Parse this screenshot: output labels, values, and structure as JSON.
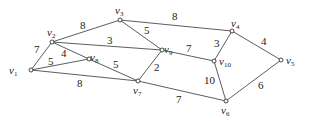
{
  "graph": {
    "nodes": [
      {
        "id": "v1",
        "label": "v",
        "sub": "1",
        "x": 31,
        "y": 70,
        "lx": 9,
        "ly": 74
      },
      {
        "id": "v2",
        "label": "v",
        "sub": "2",
        "x": 52,
        "y": 42,
        "lx": 47,
        "ly": 36
      },
      {
        "id": "v3",
        "label": "v",
        "sub": "3",
        "x": 120,
        "y": 20,
        "lx": 115,
        "ly": 14
      },
      {
        "id": "v4",
        "label": "v",
        "sub": "4",
        "x": 232,
        "y": 31,
        "lx": 231,
        "ly": 27
      },
      {
        "id": "v5",
        "label": "v",
        "sub": "5",
        "x": 281,
        "y": 60,
        "lx": 286,
        "ly": 64
      },
      {
        "id": "v6",
        "label": "v",
        "sub": "6",
        "x": 226,
        "y": 101,
        "lx": 221,
        "ly": 114
      },
      {
        "id": "v7",
        "label": "v",
        "sub": "7",
        "x": 138,
        "y": 81,
        "lx": 133,
        "ly": 94
      },
      {
        "id": "v8",
        "label": "v",
        "sub": "8",
        "x": 89,
        "y": 59,
        "lx": 90,
        "ly": 61
      },
      {
        "id": "v9",
        "label": "v",
        "sub": "9",
        "x": 162,
        "y": 50,
        "lx": 164,
        "ly": 53
      },
      {
        "id": "v10",
        "label": "v",
        "sub": "10",
        "x": 214,
        "y": 61,
        "lx": 219,
        "ly": 65
      }
    ],
    "edges": [
      {
        "from": "v1",
        "to": "v2",
        "weight": "7",
        "wx": 34,
        "wy": 53
      },
      {
        "from": "v1",
        "to": "v8",
        "weight": "5",
        "wx": 48,
        "wy": 65
      },
      {
        "from": "v1",
        "to": "v7",
        "weight": "8",
        "wx": 77,
        "wy": 87
      },
      {
        "from": "v2",
        "to": "v8",
        "weight": "4",
        "wx": 61,
        "wy": 57
      },
      {
        "from": "v2",
        "to": "v3",
        "weight": "8",
        "wx": 80,
        "wy": 29
      },
      {
        "from": "v2",
        "to": "v9",
        "weight": "3",
        "wx": 107,
        "wy": 44
      },
      {
        "from": "v8",
        "to": "v7",
        "weight": "5",
        "wx": 113,
        "wy": 68
      },
      {
        "from": "v3",
        "to": "v9",
        "weight": "5",
        "wx": 144,
        "wy": 34
      },
      {
        "from": "v3",
        "to": "v4",
        "weight": "8",
        "wx": 172,
        "wy": 20
      },
      {
        "from": "v9",
        "to": "v7",
        "weight": "2",
        "wx": 154,
        "wy": 71
      },
      {
        "from": "v9",
        "to": "v10",
        "weight": "7",
        "wx": 186,
        "wy": 52
      },
      {
        "from": "v7",
        "to": "v6",
        "weight": "7",
        "wx": 176,
        "wy": 103
      },
      {
        "from": "v4",
        "to": "v10",
        "weight": "3",
        "wx": 214,
        "wy": 47
      },
      {
        "from": "v4",
        "to": "v5",
        "weight": "4",
        "wx": 261,
        "wy": 45
      },
      {
        "from": "v10",
        "to": "v6",
        "weight": "10",
        "wx": 204,
        "wy": 84
      },
      {
        "from": "v5",
        "to": "v6",
        "weight": "6",
        "wx": 258,
        "wy": 89
      }
    ]
  }
}
